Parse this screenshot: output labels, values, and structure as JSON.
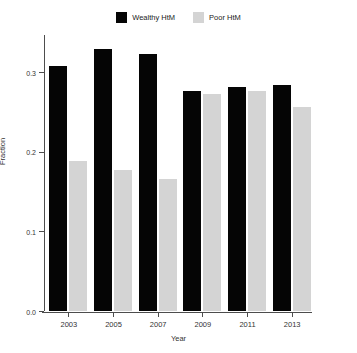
{
  "chart_data": {
    "type": "bar",
    "title": "",
    "subtitle": "",
    "xlabel": "Year",
    "ylabel": "Fraction",
    "categories": [
      "2003",
      "2005",
      "2007",
      "2009",
      "2011",
      "2013"
    ],
    "series": [
      {
        "name": "Wealthy HtM",
        "color": "#050505",
        "values": [
          0.308,
          0.329,
          0.323,
          0.277,
          0.282,
          0.284
        ]
      },
      {
        "name": "Poor HtM",
        "color": "#d4d4d4",
        "values": [
          0.188,
          0.177,
          0.166,
          0.273,
          0.276,
          0.257
        ]
      }
    ],
    "ylim": [
      0.0,
      0.347
    ],
    "yticks": [
      0.0,
      0.1,
      0.2,
      0.3
    ],
    "ytick_labels": [
      "0.0",
      "0.1",
      "0.2",
      "0.3"
    ],
    "xtick_labels": [
      "2003",
      "2005",
      "2007",
      "2009",
      "2011",
      "2013"
    ],
    "grid": false,
    "legend_position": "top-center",
    "bar_mode": "grouped"
  },
  "legend": {
    "entries": [
      {
        "label": "Wealthy HtM",
        "swatch_color": "#050505"
      },
      {
        "label": "Poor HtM",
        "swatch_color": "#d4d4d4"
      }
    ]
  },
  "axes": {
    "x_title": "Year",
    "y_title": "Fraction"
  }
}
